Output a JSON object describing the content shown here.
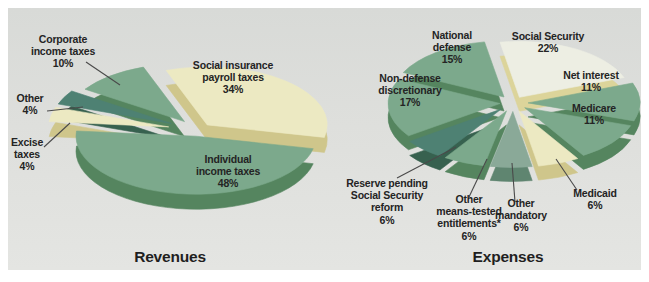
{
  "colors": {
    "page_bg": "#ffffff",
    "panel_bg": "#dedfdc",
    "label_text": "#242424",
    "leader_line": "#4a4a4a",
    "green_mid": "#7ca98c",
    "green_dark": "#4e8173",
    "cream": "#ece9c2",
    "pale_mint": "#edeee3"
  },
  "chart_data": [
    {
      "id": "revenues",
      "type": "pie",
      "title": "Revenues",
      "unit": "percent",
      "legend": "none",
      "layout": {
        "cx": 198,
        "cy": 130,
        "rx": 120,
        "ry": 58,
        "depth": 15,
        "start_angle": -20
      },
      "slices": [
        {
          "id": "social-insurance-payroll-taxes",
          "label": "Social insurance payroll taxes",
          "value": 34,
          "display": "Social insurance\npayroll taxes\n34%",
          "color": "#ece9c2",
          "side_color": "#cfc68b",
          "explode": 14
        },
        {
          "id": "individual-income-taxes",
          "label": "Individual income taxes",
          "value": 48,
          "display": "Individual\nincome taxes\n48%",
          "color": "#7ca98c",
          "side_color": "#55855f",
          "explode": 13
        },
        {
          "id": "excise-taxes",
          "label": "Excise taxes",
          "value": 4,
          "display": "Excise\ntaxes\n4%",
          "color": "#ece9c2",
          "side_color": "#cfc68b",
          "explode": 30
        },
        {
          "id": "other",
          "label": "Other",
          "value": 4,
          "display": "Other\n4%",
          "color": "#4e8173",
          "side_color": "#37614f",
          "explode": 30
        },
        {
          "id": "corporate-income-taxes",
          "label": "Corporate income taxes",
          "value": 10,
          "display": "Corporate\nincome taxes\n10%",
          "color": "#7ca98c",
          "side_color": "#55855f",
          "explode": 22
        }
      ]
    },
    {
      "id": "expenses",
      "type": "pie",
      "title": "Expenses",
      "unit": "percent",
      "legend": "none",
      "layout": {
        "cx": 513,
        "cy": 103,
        "rx": 112,
        "ry": 56,
        "depth": 14,
        "start_angle": -10
      },
      "slices": [
        {
          "id": "social-security",
          "label": "Social Security",
          "value": 22,
          "display": "Social Security\n22%",
          "color": "#edeee3",
          "side_color": "#dcd49a",
          "explode": 13
        },
        {
          "id": "net-interest",
          "label": "Net interest",
          "value": 11,
          "display": "Net interest\n11%",
          "color": "#7ca98c",
          "side_color": "#55855f",
          "explode": 15
        },
        {
          "id": "medicare",
          "label": "Medicare",
          "value": 11,
          "display": "Medicare\n11%",
          "color": "#7ca98c",
          "side_color": "#55855f",
          "explode": 15
        },
        {
          "id": "medicaid",
          "label": "Medicaid",
          "value": 6,
          "display": "Medicaid\n6%",
          "color": "#ece9c2",
          "side_color": "#cfc68b",
          "explode": 17
        },
        {
          "id": "other-mandatory",
          "label": "Other mandatory",
          "value": 6,
          "display": "Other\nmandatory\n6%",
          "color": "#8aa998",
          "side_color": "#5f8570",
          "explode": 17
        },
        {
          "id": "other-means-tested-entitlements",
          "label": "Other means-tested entitlements*",
          "value": 6,
          "display": "Other\nmeans-tested\nentitlements*\n6%",
          "color": "#7ca98c",
          "side_color": "#55855f",
          "explode": 17
        },
        {
          "id": "reserve-pending-social-security-reform",
          "label": "Reserve pending Social Security reform",
          "value": 6,
          "display": "Reserve pending\nSocial Security\nreform\n6%",
          "color": "#4e8173",
          "side_color": "#37614f",
          "explode": 17
        },
        {
          "id": "non-defense-discretionary",
          "label": "Non-defense discretionary",
          "value": 17,
          "display": "Non-defense\ndiscretionary\n17%",
          "color": "#7ca98c",
          "side_color": "#55855f",
          "explode": 13
        },
        {
          "id": "national-defense",
          "label": "National defense",
          "value": 15,
          "display": "National\ndefense\n15%",
          "color": "#7ca98c",
          "side_color": "#55855f",
          "explode": 15
        }
      ]
    }
  ]
}
